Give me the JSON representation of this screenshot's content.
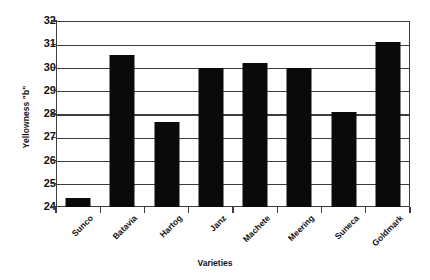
{
  "chart_data": {
    "type": "bar",
    "title": "",
    "xlabel": "Varieties",
    "ylabel": "Yellowness \"b\"",
    "categories": [
      "Sunco",
      "Batavia",
      "Hartog",
      "Janz",
      "Machete",
      "Meering",
      "Suneca",
      "Goldmark"
    ],
    "values": [
      24.4,
      30.55,
      27.65,
      30.0,
      30.2,
      30.0,
      28.1,
      31.1
    ],
    "ylim": [
      24,
      32
    ],
    "yticks": [
      24,
      25,
      26,
      27,
      28,
      29,
      30,
      31,
      32
    ],
    "ytick_labels": [
      "24",
      "25",
      "26",
      "27",
      "28",
      "29",
      "30",
      "31",
      "32"
    ],
    "grid": "horizontal",
    "legend": "none",
    "bar_color": "#0a0a0a",
    "axis_color": "#3d3d3d",
    "background": "#ffffff"
  }
}
